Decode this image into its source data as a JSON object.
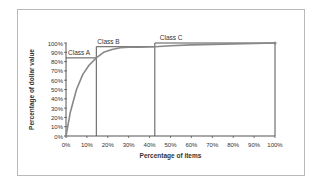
{
  "chart_data": {
    "type": "line",
    "title": "",
    "xlabel": "Percentage of items",
    "ylabel": "Percentage of dollar value",
    "x_ticks": [
      "0%",
      "10%",
      "20%",
      "30%",
      "40%",
      "50%",
      "60%",
      "70%",
      "80%",
      "90%",
      "100%"
    ],
    "y_ticks": [
      "0%",
      "10%",
      "20%",
      "30%",
      "40%",
      "50%",
      "60%",
      "70%",
      "80%",
      "90%",
      "100%"
    ],
    "xlim": [
      0,
      100
    ],
    "ylim": [
      0,
      100
    ],
    "grid": false,
    "series": [
      {
        "name": "Cumulative dollar value",
        "x": [
          0,
          2,
          5,
          8,
          11,
          14.5,
          18,
          22,
          26,
          30,
          35,
          42.5,
          50,
          60,
          70,
          80,
          90,
          100
        ],
        "y": [
          0,
          25,
          50,
          66,
          76,
          84,
          90,
          93,
          95,
          95.5,
          95.5,
          96,
          97,
          98,
          98.5,
          99,
          99.5,
          100
        ]
      }
    ],
    "annotations": [
      {
        "label": "Class A",
        "x_range": [
          0,
          14.5
        ],
        "y_level": 84
      },
      {
        "label": "Class B",
        "x_range": [
          14.5,
          42.5
        ],
        "y_level": 96
      },
      {
        "label": "Class C",
        "x_range": [
          42.5,
          100
        ],
        "y_level": 100
      }
    ]
  }
}
